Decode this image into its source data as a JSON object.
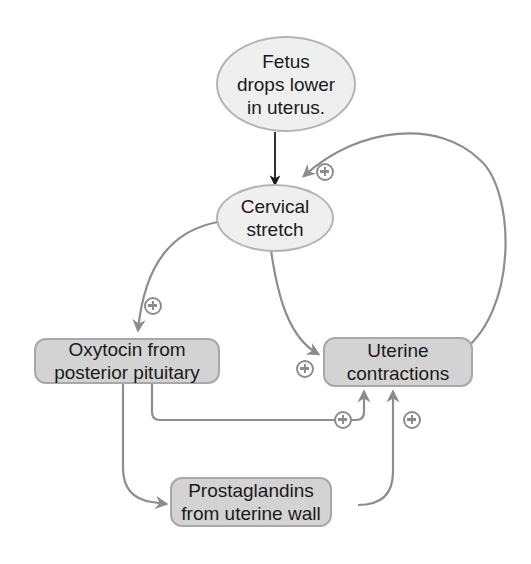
{
  "diagram": {
    "type": "positive feedback loop",
    "nodes": {
      "fetus": {
        "label_lines": [
          "Fetus",
          "drops lower",
          "in uterus."
        ],
        "shape": "ellipse"
      },
      "cervical": {
        "label_lines": [
          "Cervical",
          "stretch"
        ],
        "shape": "ellipse"
      },
      "oxytocin": {
        "label_lines": [
          "Oxytocin from",
          "posterior pituitary"
        ],
        "shape": "rounded-box"
      },
      "uterine": {
        "label_lines": [
          "Uterine",
          "contractions"
        ],
        "shape": "rounded-box"
      },
      "prostaglandins": {
        "label_lines": [
          "Prostaglandins",
          "from uterine wall"
        ],
        "shape": "rounded-box"
      }
    },
    "edges": [
      {
        "from": "Fetus drops lower in uterus.",
        "to": "Cervical stretch",
        "sign": ""
      },
      {
        "from": "Cervical stretch",
        "to": "Oxytocin from posterior pituitary",
        "sign": "+"
      },
      {
        "from": "Cervical stretch",
        "to": "Uterine contractions",
        "sign": "+"
      },
      {
        "from": "Uterine contractions",
        "to": "Cervical stretch",
        "sign": "+"
      },
      {
        "from": "Oxytocin from posterior pituitary",
        "to": "Uterine contractions",
        "sign": "+"
      },
      {
        "from": "Oxytocin from posterior pituitary",
        "to": "Prostaglandins from uterine wall",
        "sign": ""
      },
      {
        "from": "Prostaglandins from uterine wall",
        "to": "Uterine contractions",
        "sign": "+"
      }
    ],
    "sign_symbol": "+",
    "colors": {
      "ellipse_fill": "#efefef",
      "ellipse_border": "#b4b4b4",
      "box_fill": "#d3d3d3",
      "box_border": "#a8a8a8",
      "arrow_grey": "#8d8d8d",
      "arrow_black": "#1a1a1a"
    }
  }
}
